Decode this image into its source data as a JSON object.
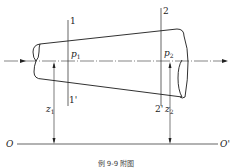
{
  "diagram": {
    "type": "pipe-flow-sections",
    "sections": [
      {
        "id": "1",
        "top_label": "1",
        "bottom_label": "1'",
        "pressure": "p",
        "pressure_sub": "1",
        "height": "z",
        "height_sub": "1"
      },
      {
        "id": "2",
        "top_label": "2",
        "bottom_label": "2'",
        "pressure": "p",
        "pressure_sub": "2",
        "height": "z",
        "height_sub": "2"
      }
    ],
    "datum": {
      "left_label": "O",
      "right_label": "O'"
    },
    "caption": "例 9-9 附图",
    "colors": {
      "line": "#1a1a1a",
      "background": "#ffffff"
    }
  }
}
